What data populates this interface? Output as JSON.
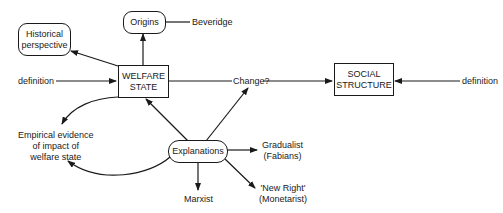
{
  "nodes": {
    "welfare_state": "WELFARE\nSTATE",
    "origins": "Origins",
    "beveridge": "Beveridge",
    "historical": "Historical\nperspective",
    "definition_left": "definition",
    "change": "Change?",
    "social_structure": "SOCIAL\nSTRUCTURE",
    "definition_right": "definition",
    "empirical": "Empirical evidence\nof impact of\nwelfare state",
    "explanations": "Explanations",
    "gradualist": "Gradualist\n(Fabians)",
    "new_right": "'New Right'\n(Monetarist)",
    "marxist": "Marxist"
  },
  "colors": {
    "line": "#1a1a1a",
    "background": "#ffffff"
  }
}
